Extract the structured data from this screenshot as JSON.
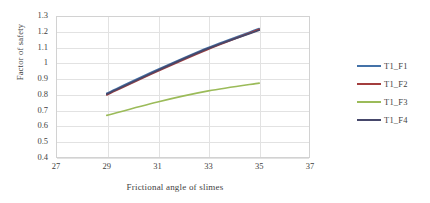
{
  "chart_data": {
    "type": "line",
    "title": "",
    "xlabel": "Frictional angle of slimes",
    "ylabel": "Factor of safety",
    "xlim": [
      27,
      37
    ],
    "ylim": [
      0.4,
      1.3
    ],
    "xticks": [
      "27",
      "29",
      "31",
      "33",
      "35",
      "37"
    ],
    "yticks": [
      "1.3",
      "1.2",
      "1.1",
      "1",
      "0.9",
      "0.8",
      "0.7",
      "0.6",
      "0.5",
      "0.4"
    ],
    "grid": true,
    "legend_position": "right",
    "x": [
      29,
      31,
      33,
      35
    ],
    "series": [
      {
        "name": "T1_F1",
        "color": "#4472a8",
        "values": [
          0.81,
          0.96,
          1.1,
          1.22
        ]
      },
      {
        "name": "T1_F2",
        "color": "#a33e3e",
        "values": [
          0.8,
          0.95,
          1.09,
          1.215
        ]
      },
      {
        "name": "T1_F3",
        "color": "#9bbb59",
        "values": [
          0.67,
          0.755,
          0.825,
          0.875
        ]
      },
      {
        "name": "T1_F4",
        "color": "#46486b",
        "values": [
          0.805,
          0.955,
          1.095,
          1.21
        ]
      }
    ]
  },
  "legend": {
    "items": [
      {
        "label": "T1_F1",
        "color": "#4472a8"
      },
      {
        "label": "T1_F2",
        "color": "#a33e3e"
      },
      {
        "label": "T1_F3",
        "color": "#9bbb59"
      },
      {
        "label": "T1_F4",
        "color": "#46486b"
      }
    ]
  },
  "axes": {
    "y_title": "Factor of safety",
    "x_title": "Frictional angle of slimes"
  }
}
